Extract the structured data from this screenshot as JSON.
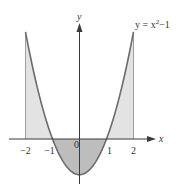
{
  "chart_data": {
    "type": "line",
    "title": "",
    "equation_label": "y = x²−1",
    "equation": {
      "base": "y = x",
      "sup": "2",
      "tail": "−1"
    },
    "xlabel": "x",
    "ylabel": "y",
    "xlim": [
      -2.5,
      2.8
    ],
    "ylim": [
      -1.3,
      3.6
    ],
    "x_ticks": [
      {
        "value": -2,
        "label": "−2"
      },
      {
        "value": -1,
        "label": "−1"
      },
      {
        "value": 0,
        "label": "0"
      },
      {
        "value": 1,
        "label": "1"
      },
      {
        "value": 2,
        "label": "2"
      }
    ],
    "series": [
      {
        "name": "y = x^2 - 1",
        "x": [
          -2,
          -1.5,
          -1,
          -0.5,
          0,
          0.5,
          1,
          1.5,
          2
        ],
        "y": [
          3,
          1.25,
          0,
          -0.75,
          -1,
          -0.75,
          0,
          1.25,
          3
        ]
      }
    ],
    "shaded_regions": [
      {
        "from": -2,
        "to": -1,
        "position": "above x-axis",
        "shade": "light"
      },
      {
        "from": -1,
        "to": 1,
        "position": "below x-axis",
        "shade": "dark"
      },
      {
        "from": 1,
        "to": 2,
        "position": "above x-axis",
        "shade": "light"
      }
    ],
    "grid": false,
    "legend": "none"
  },
  "colors": {
    "curve": "#6b6b6b",
    "axis": "#3a3a3a",
    "light_fill": "#e3e3e3",
    "dark_fill": "#bdbdbd"
  }
}
